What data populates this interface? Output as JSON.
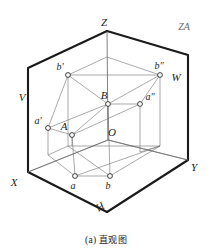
{
  "figure": {
    "caption_index": "(a)",
    "caption_text": "直观图",
    "corner_note": "ZA",
    "type": "descriptive-geometry-pictorial"
  },
  "axes": [
    {
      "id": "z",
      "label": "Z",
      "x": 107,
      "y": 22
    },
    {
      "id": "x",
      "label": "X",
      "x": 16,
      "y": 182
    },
    {
      "id": "y",
      "label": "Y",
      "x": 192,
      "y": 168
    }
  ],
  "planes": [
    {
      "id": "v",
      "label": "V",
      "x": 24,
      "y": 97
    },
    {
      "id": "w",
      "label": "W",
      "x": 175,
      "y": 77
    },
    {
      "id": "h",
      "label": "H",
      "x": 103,
      "y": 208
    }
  ],
  "points": [
    {
      "id": "A",
      "label": "A",
      "lx": 65,
      "ly": 127,
      "px": 72,
      "py": 135
    },
    {
      "id": "B",
      "label": "B",
      "lx": 104,
      "ly": 96,
      "px": 108,
      "py": 104
    },
    {
      "id": "O",
      "label": "O",
      "lx": 106,
      "ly": 133,
      "px": 108,
      "py": 140
    },
    {
      "id": "a1",
      "label": "a'",
      "lx": 36,
      "ly": 123,
      "px": 48,
      "py": 128
    },
    {
      "id": "b1",
      "label": "b'",
      "lx": 58,
      "ly": 68,
      "px": 68,
      "py": 75
    },
    {
      "id": "a2",
      "label": "a\"",
      "lx": 144,
      "ly": 97,
      "px": 140,
      "py": 104
    },
    {
      "id": "b2",
      "label": "b\"",
      "lx": 155,
      "ly": 66,
      "px": 160,
      "py": 75
    },
    {
      "id": "a",
      "label": "a",
      "lx": 71,
      "ly": 186,
      "px": 75,
      "py": 176
    },
    {
      "id": "b",
      "label": "b",
      "lx": 106,
      "ly": 186,
      "px": 110,
      "py": 176
    }
  ],
  "colors": {
    "ink": "#1a1a1a",
    "light_line": "#4a4a4a",
    "thin_line": "#707070",
    "background": "#ffffff",
    "note": "#6a6a6a"
  }
}
